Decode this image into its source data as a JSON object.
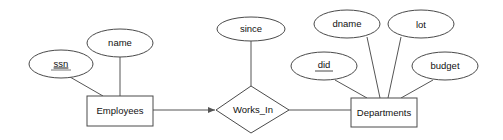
{
  "diagram": {
    "type": "er-diagram",
    "entities": [
      {
        "id": "employees",
        "label": "Employees"
      },
      {
        "id": "departments",
        "label": "Departments"
      }
    ],
    "relationships": [
      {
        "id": "works_in",
        "label": "Works_In"
      }
    ],
    "attributes": {
      "ssn": {
        "label": "ssn",
        "key": true,
        "of": "Employees"
      },
      "name": {
        "label": "name",
        "key": false,
        "of": "Employees"
      },
      "since": {
        "label": "since",
        "key": false,
        "of": "Works_In"
      },
      "did": {
        "label": "did",
        "key": true,
        "of": "Departments"
      },
      "dname": {
        "label": "dname",
        "key": false,
        "of": "Departments"
      },
      "lot": {
        "label": "lot",
        "key": false,
        "of": "Departments"
      },
      "budget": {
        "label": "budget",
        "key": false,
        "of": "Departments"
      }
    },
    "edges": [
      {
        "from": "Employees",
        "to": "Works_In",
        "style": "arrow"
      },
      {
        "from": "Works_In",
        "to": "Departments",
        "style": "line"
      }
    ]
  }
}
